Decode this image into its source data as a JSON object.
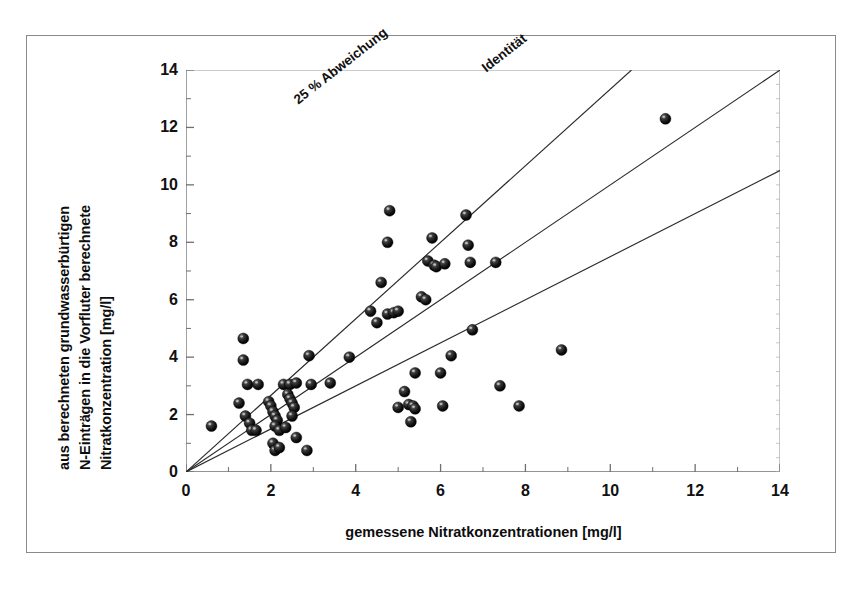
{
  "figure": {
    "type": "scatter-plot",
    "background": "#ffffff",
    "border_color": "#8a8a8a"
  },
  "axes": {
    "ylabel_lines": [
      "aus berechneten grundwasserbürtigen",
      "N-Einträgen in die Vorfluter berechnete",
      "Nitratkonzentration [mg/l]"
    ],
    "xlabel": "gemessene Nitratkonzentrationen [mg/l]",
    "xticks": [
      0,
      2,
      4,
      6,
      8,
      10,
      12,
      14
    ],
    "yticks": [
      0,
      2,
      4,
      6,
      8,
      10,
      12,
      14
    ],
    "xminor_step": 1,
    "yminor_step": 1
  },
  "annotations": [
    {
      "id": "abweichung",
      "text": "25 % Abweichung"
    },
    {
      "id": "identitaet",
      "text": "Identität"
    }
  ],
  "chart_data": {
    "type": "scatter",
    "title": "",
    "xlabel": "gemessene Nitratkonzentrationen [mg/l]",
    "ylabel": "aus berechneten grundwasserbürtigen N-Einträgen in die Vorfluter berechnete Nitratkonzentration [mg/l]",
    "xlim": [
      0,
      14
    ],
    "ylim": [
      0,
      14
    ],
    "grid": false,
    "legend": "none",
    "marker": {
      "shape": "sphere",
      "color": "#1a1a1a",
      "size_px": 11
    },
    "reference_lines": [
      {
        "name": "25 % Abweichung",
        "slope": 1.3333,
        "intercept": 0,
        "label": "25 % Abweichung"
      },
      {
        "name": "Identität",
        "slope": 1.0,
        "intercept": 0,
        "label": "Identität"
      },
      {
        "name": "untere 25 % Abweichung",
        "slope": 0.75,
        "intercept": 0,
        "label": ""
      }
    ],
    "points": [
      [
        0.6,
        1.6
      ],
      [
        1.35,
        4.65
      ],
      [
        1.35,
        3.9
      ],
      [
        1.25,
        2.4
      ],
      [
        1.45,
        3.05
      ],
      [
        1.7,
        3.05
      ],
      [
        1.4,
        1.95
      ],
      [
        1.5,
        1.7
      ],
      [
        1.55,
        1.45
      ],
      [
        1.65,
        1.45
      ],
      [
        1.95,
        2.45
      ],
      [
        2.0,
        2.3
      ],
      [
        2.05,
        2.1
      ],
      [
        2.1,
        1.95
      ],
      [
        2.15,
        1.8
      ],
      [
        2.1,
        1.6
      ],
      [
        2.2,
        1.45
      ],
      [
        2.05,
        1.0
      ],
      [
        2.1,
        0.75
      ],
      [
        2.2,
        0.85
      ],
      [
        2.3,
        3.05
      ],
      [
        2.45,
        3.05
      ],
      [
        2.6,
        3.1
      ],
      [
        2.4,
        2.7
      ],
      [
        2.45,
        2.55
      ],
      [
        2.5,
        2.4
      ],
      [
        2.55,
        2.25
      ],
      [
        2.5,
        1.95
      ],
      [
        2.35,
        1.55
      ],
      [
        2.6,
        1.2
      ],
      [
        2.85,
        0.75
      ],
      [
        2.9,
        4.05
      ],
      [
        2.95,
        3.05
      ],
      [
        3.4,
        3.1
      ],
      [
        3.85,
        4.0
      ],
      [
        4.35,
        5.6
      ],
      [
        4.5,
        5.2
      ],
      [
        4.6,
        6.6
      ],
      [
        4.75,
        8.0
      ],
      [
        4.8,
        9.1
      ],
      [
        4.75,
        5.5
      ],
      [
        4.9,
        5.55
      ],
      [
        5.0,
        5.6
      ],
      [
        5.0,
        2.25
      ],
      [
        5.15,
        2.8
      ],
      [
        5.25,
        2.35
      ],
      [
        5.35,
        2.3
      ],
      [
        5.4,
        2.2
      ],
      [
        5.3,
        1.75
      ],
      [
        5.4,
        3.45
      ],
      [
        5.55,
        6.1
      ],
      [
        5.65,
        6.0
      ],
      [
        5.7,
        7.35
      ],
      [
        5.8,
        8.15
      ],
      [
        5.85,
        7.2
      ],
      [
        5.9,
        7.15
      ],
      [
        6.1,
        7.25
      ],
      [
        6.25,
        4.05
      ],
      [
        6.0,
        3.45
      ],
      [
        6.05,
        2.3
      ],
      [
        6.6,
        8.95
      ],
      [
        6.65,
        7.9
      ],
      [
        6.7,
        7.3
      ],
      [
        6.75,
        4.95
      ],
      [
        7.3,
        7.3
      ],
      [
        7.4,
        3.0
      ],
      [
        7.85,
        2.3
      ],
      [
        8.85,
        4.25
      ],
      [
        11.3,
        12.3
      ]
    ]
  }
}
